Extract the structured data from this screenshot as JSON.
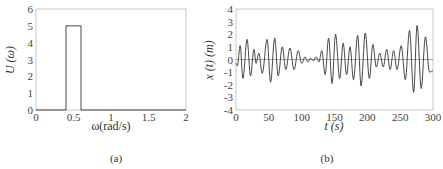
{
  "chart_data": [
    {
      "id": "a",
      "type": "line",
      "caption": "(a)",
      "title": "",
      "xlabel": "ω(rad/s)",
      "ylabel": "U (ω)",
      "xlim": [
        0,
        2
      ],
      "ylim": [
        0,
        6
      ],
      "xticks": [
        0,
        0.5,
        1,
        1.5,
        2
      ],
      "xtick_labels": [
        "0",
        "0.5",
        "1",
        "1.5",
        "2"
      ],
      "yticks": [
        0,
        1,
        2,
        3,
        4,
        5,
        6
      ],
      "ytick_labels": [
        "0",
        "1",
        "2",
        "3",
        "4",
        "5",
        "6"
      ],
      "grid": false,
      "series": [
        {
          "name": "U(ω)",
          "x": [
            0,
            0.4,
            0.4,
            0.6,
            0.6,
            2
          ],
          "y": [
            0,
            0,
            5,
            5,
            0,
            0
          ]
        }
      ]
    },
    {
      "id": "b",
      "type": "line",
      "caption": "(b)",
      "title": "",
      "xlabel": "t (s)",
      "ylabel": "x (t) (m)",
      "xlim": [
        0,
        300
      ],
      "ylim": [
        -4,
        4
      ],
      "xticks": [
        0,
        50,
        100,
        150,
        200,
        250,
        300
      ],
      "xtick_labels": [
        "0",
        "50",
        "100",
        "150",
        "200",
        "250",
        "300"
      ],
      "yticks": [
        -4,
        -3,
        -2,
        -1,
        0,
        1,
        2,
        3,
        4
      ],
      "ytick_labels": [
        "-4",
        "-3",
        "-2",
        "-1",
        "0",
        "1",
        "2",
        "3",
        "4"
      ],
      "grid": false,
      "zero_line": true,
      "series": [
        {
          "name": "x(t)",
          "description": "random wave elevation, narrow-band around 0.5 rad/s",
          "x": [
            0,
            3,
            7,
            12,
            17,
            22,
            27,
            31,
            35,
            39,
            44,
            48,
            53,
            57,
            62,
            66,
            71,
            75,
            80,
            84,
            89,
            93,
            98,
            102,
            107,
            111,
            115,
            119,
            123,
            127,
            131,
            136,
            141,
            146,
            150,
            155,
            159,
            164,
            168,
            173,
            177,
            182,
            186,
            191,
            196,
            200,
            205,
            209,
            214,
            218,
            223,
            227,
            232,
            236,
            241,
            245,
            250,
            254,
            259,
            263,
            268,
            273,
            277,
            282,
            287,
            291,
            296,
            300
          ],
          "y": [
            -0.3,
            -0.5,
            1.1,
            -1.5,
            1.6,
            -1.3,
            0.8,
            -0.3,
            0.5,
            -1.1,
            1.6,
            -1.8,
            1.7,
            -1.3,
            1.0,
            -0.8,
            0.9,
            -0.8,
            0.7,
            -0.3,
            0.2,
            -0.2,
            0.1,
            0.2,
            -0.2,
            0.7,
            -1.2,
            1.7,
            -1.9,
            2.0,
            -1.5,
            1.3,
            -1.2,
            1.0,
            -1.6,
            1.9,
            -2.1,
            2.1,
            -1.5,
            1.2,
            -0.6,
            0.5,
            -0.6,
            0.8,
            -0.8,
            0.7,
            -0.8,
            1.1,
            -1.6,
            2.3,
            -2.6,
            2.7,
            -2.3,
            1.8,
            -1.0,
            -0.9,
            0,
            0,
            0,
            0,
            0,
            0,
            0,
            0,
            0,
            0,
            0,
            0
          ]
        }
      ]
    }
  ]
}
